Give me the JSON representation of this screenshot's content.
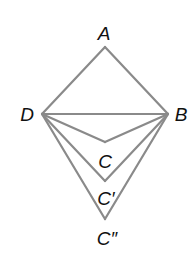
{
  "diagram": {
    "type": "geometry-figure",
    "line_color": "#8a8a8a",
    "label_color": "#111111",
    "points": {
      "A": {
        "label": "A",
        "x": 105,
        "y": 47
      },
      "B": {
        "label": "B",
        "x": 168,
        "y": 114
      },
      "D": {
        "label": "D",
        "x": 42,
        "y": 114
      },
      "C": {
        "label": "C",
        "x": 105,
        "y": 142
      },
      "C1": {
        "label": "C′",
        "x": 105,
        "y": 181
      },
      "C2": {
        "label": "C″",
        "x": 105,
        "y": 219
      }
    },
    "segments": [
      [
        "A",
        "D"
      ],
      [
        "A",
        "B"
      ],
      [
        "D",
        "B"
      ],
      [
        "D",
        "C"
      ],
      [
        "C",
        "B"
      ],
      [
        "D",
        "C1"
      ],
      [
        "C1",
        "B"
      ],
      [
        "D",
        "C2"
      ],
      [
        "C2",
        "B"
      ]
    ]
  }
}
